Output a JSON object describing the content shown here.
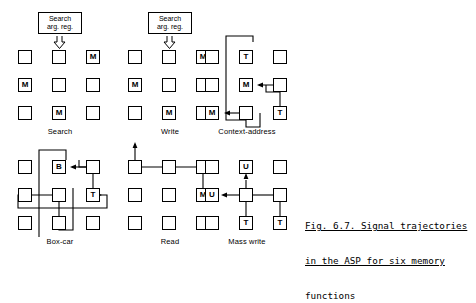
{
  "figure": {
    "caption_line1": "Fig. 6.7. Signal trajectories",
    "caption_line2": "in the ASP for six memory",
    "caption_line3": "functions",
    "ink_color": "#000000",
    "background_color": "#ffffff"
  },
  "panels": [
    {
      "id": "search",
      "label": "Search",
      "has_search_arg_reg": true,
      "search_arg_reg_line1": "Search",
      "search_arg_reg_line2": "arg. reg.",
      "cells": [
        {
          "row": 1,
          "col": 1,
          "text": ""
        },
        {
          "row": 1,
          "col": 2,
          "text": ""
        },
        {
          "row": 1,
          "col": 3,
          "text": "M"
        },
        {
          "row": 2,
          "col": 1,
          "text": "M"
        },
        {
          "row": 2,
          "col": 2,
          "text": ""
        },
        {
          "row": 2,
          "col": 3,
          "text": ""
        },
        {
          "row": 3,
          "col": 1,
          "text": ""
        },
        {
          "row": 3,
          "col": 2,
          "text": "M"
        },
        {
          "row": 3,
          "col": 3,
          "text": ""
        }
      ]
    },
    {
      "id": "write",
      "label": "Write",
      "has_search_arg_reg": true,
      "search_arg_reg_line1": "Search",
      "search_arg_reg_line2": "arg. reg.",
      "cells": [
        {
          "row": 1,
          "col": 1,
          "text": ""
        },
        {
          "row": 1,
          "col": 2,
          "text": ""
        },
        {
          "row": 1,
          "col": 3,
          "text": "M"
        },
        {
          "row": 2,
          "col": 1,
          "text": "M"
        },
        {
          "row": 2,
          "col": 2,
          "text": ""
        },
        {
          "row": 2,
          "col": 3,
          "text": ""
        },
        {
          "row": 3,
          "col": 1,
          "text": ""
        },
        {
          "row": 3,
          "col": 2,
          "text": "M"
        },
        {
          "row": 3,
          "col": 3,
          "text": ""
        }
      ]
    },
    {
      "id": "context-address",
      "label": "Context-address",
      "has_search_arg_reg": false,
      "cells": [
        {
          "row": 1,
          "col": 1,
          "text": ""
        },
        {
          "row": 1,
          "col": 2,
          "text": "T"
        },
        {
          "row": 1,
          "col": 3,
          "text": ""
        },
        {
          "row": 2,
          "col": 1,
          "text": ""
        },
        {
          "row": 2,
          "col": 2,
          "text": "M"
        },
        {
          "row": 2,
          "col": 3,
          "text": ""
        },
        {
          "row": 3,
          "col": 1,
          "text": "M"
        },
        {
          "row": 3,
          "col": 2,
          "text": ""
        },
        {
          "row": 3,
          "col": 3,
          "text": "T"
        }
      ]
    },
    {
      "id": "box-car",
      "label": "Box-car",
      "has_search_arg_reg": false,
      "cells": [
        {
          "row": 1,
          "col": 1,
          "text": ""
        },
        {
          "row": 1,
          "col": 2,
          "text": "B"
        },
        {
          "row": 1,
          "col": 3,
          "text": ""
        },
        {
          "row": 2,
          "col": 1,
          "text": ""
        },
        {
          "row": 2,
          "col": 2,
          "text": ""
        },
        {
          "row": 2,
          "col": 3,
          "text": "T"
        },
        {
          "row": 3,
          "col": 1,
          "text": ""
        },
        {
          "row": 3,
          "col": 2,
          "text": ""
        },
        {
          "row": 3,
          "col": 3,
          "text": ""
        }
      ]
    },
    {
      "id": "read",
      "label": "Read",
      "has_search_arg_reg": false,
      "cells": [
        {
          "row": 1,
          "col": 1,
          "text": ""
        },
        {
          "row": 1,
          "col": 2,
          "text": ""
        },
        {
          "row": 1,
          "col": 3,
          "text": ""
        },
        {
          "row": 2,
          "col": 1,
          "text": ""
        },
        {
          "row": 2,
          "col": 2,
          "text": ""
        },
        {
          "row": 2,
          "col": 3,
          "text": "M"
        },
        {
          "row": 3,
          "col": 1,
          "text": ""
        },
        {
          "row": 3,
          "col": 2,
          "text": ""
        },
        {
          "row": 3,
          "col": 3,
          "text": ""
        }
      ]
    },
    {
      "id": "mass-write",
      "label": "Mass write",
      "has_search_arg_reg": false,
      "cells": [
        {
          "row": 1,
          "col": 1,
          "text": ""
        },
        {
          "row": 1,
          "col": 2,
          "text": "U"
        },
        {
          "row": 1,
          "col": 3,
          "text": ""
        },
        {
          "row": 2,
          "col": 1,
          "text": "U"
        },
        {
          "row": 2,
          "col": 2,
          "text": ""
        },
        {
          "row": 2,
          "col": 3,
          "text": ""
        },
        {
          "row": 3,
          "col": 1,
          "text": ""
        },
        {
          "row": 3,
          "col": 2,
          "text": "T"
        },
        {
          "row": 3,
          "col": 3,
          "text": "T"
        }
      ]
    }
  ]
}
